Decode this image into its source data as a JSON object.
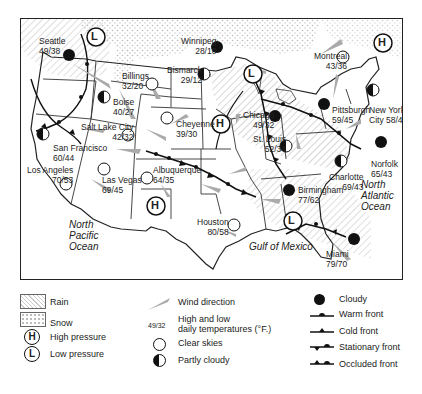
{
  "map": {
    "cities": [
      {
        "name": "Seattle",
        "temps": "49/38",
        "sky": "cloudy"
      },
      {
        "name": "Winnipeg",
        "temps": "28/10",
        "sky": "cloudy"
      },
      {
        "name": "Billings",
        "temps": "32/20",
        "sky": "clear"
      },
      {
        "name": "Bismarck",
        "temps": "29/12",
        "sky": "partly-cloudy"
      },
      {
        "name": "Boise",
        "temps": "40/27",
        "sky": "partly-cloudy"
      },
      {
        "name": "Montreal",
        "temps": "43/36",
        "sky": "clear"
      },
      {
        "name": "Salt Lake City",
        "temps": "42/32",
        "sky": "clear"
      },
      {
        "name": "Cheyenne",
        "temps": "39/30",
        "sky": "clear"
      },
      {
        "name": "Chicago",
        "temps": "49/32",
        "sky": "cloudy"
      },
      {
        "name": "Pittsburgh",
        "temps": "59/45",
        "sky": "cloudy"
      },
      {
        "name": "New York City",
        "temps": "58/42",
        "sky": "partly-cloudy"
      },
      {
        "name": "San Francisco",
        "temps": "60/44",
        "sky": "partly-cloudy"
      },
      {
        "name": "St. Louis",
        "temps": "52/34",
        "sky": "partly-cloudy"
      },
      {
        "name": "Norfolk",
        "temps": "65/43",
        "sky": "cloudy"
      },
      {
        "name": "Los Angeles",
        "temps": "70/53",
        "sky": "clear"
      },
      {
        "name": "Las Vegas",
        "temps": "69/45",
        "sky": "clear"
      },
      {
        "name": "Albuquerque",
        "temps": "64/35",
        "sky": "clear"
      },
      {
        "name": "Charlotte",
        "temps": "69/43",
        "sky": "partly-cloudy"
      },
      {
        "name": "Birmingham",
        "temps": "77/62",
        "sky": "cloudy"
      },
      {
        "name": "Houston",
        "temps": "80/58",
        "sky": "clear"
      },
      {
        "name": "Miami",
        "temps": "79/70",
        "sky": "cloudy"
      }
    ],
    "pressure_centers": [
      {
        "type": "L",
        "label": "L",
        "location": "Pacific Northwest"
      },
      {
        "type": "H",
        "label": "H",
        "location": "Northeast"
      },
      {
        "type": "L",
        "label": "L",
        "location": "Great Lakes"
      },
      {
        "type": "H",
        "label": "H",
        "location": "Central Plains"
      },
      {
        "type": "H",
        "label": "H",
        "location": "New Mexico"
      },
      {
        "type": "L",
        "label": "L",
        "location": "Gulf Coast"
      }
    ],
    "oceans": {
      "pacific": [
        "North",
        "Pacific",
        "Ocean"
      ],
      "atlantic": [
        "North",
        "Atlantic",
        "Ocean"
      ],
      "gulf": "Gulf of Mexico"
    }
  },
  "legend": {
    "rain": "Rain",
    "snow": "Snow",
    "high_pressure": "High pressure",
    "low_pressure": "Low pressure",
    "high_symbol": "H",
    "low_symbol": "L",
    "wind_direction": "Wind direction",
    "temps_sample": "49/32",
    "temps_line1": "High and low",
    "temps_line2": "daily temperatures (°F.)",
    "clear_skies": "Clear skies",
    "partly_cloudy": "Partly cloudy",
    "cloudy": "Cloudy",
    "warm_front": "Warm front",
    "cold_front": "Cold front",
    "stationary_front": "Stationary front",
    "occluded_front": "Occluded front"
  }
}
